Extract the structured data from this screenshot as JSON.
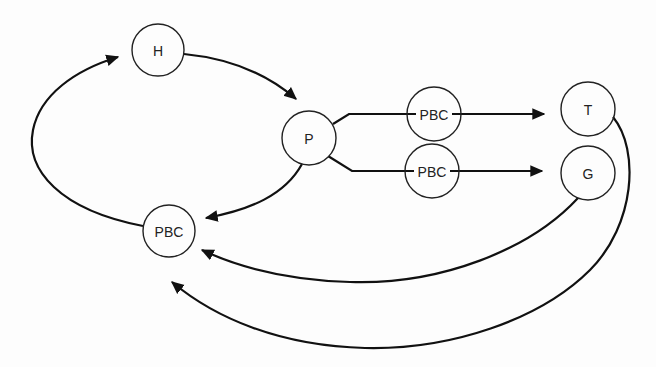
{
  "diagram": {
    "nodes": [
      {
        "id": "H",
        "label": "H",
        "cx": 158,
        "cy": 50,
        "r": 26
      },
      {
        "id": "P",
        "label": "P",
        "cx": 309,
        "cy": 138,
        "r": 27
      },
      {
        "id": "PBC_upper",
        "label": "PBC",
        "cx": 434,
        "cy": 114,
        "r": 27
      },
      {
        "id": "PBC_lower",
        "label": "PBC",
        "cx": 432,
        "cy": 171,
        "r": 27
      },
      {
        "id": "T",
        "label": "T",
        "cx": 588,
        "cy": 109,
        "r": 27
      },
      {
        "id": "G",
        "label": "G",
        "cx": 588,
        "cy": 173,
        "r": 27
      },
      {
        "id": "PBC_left",
        "label": "PBC",
        "cx": 169,
        "cy": 231,
        "r": 26
      }
    ],
    "edges": [
      {
        "from": "PBC_left",
        "to": "H",
        "style": "curved-arrow"
      },
      {
        "from": "H",
        "to": "P",
        "style": "curved-arrow"
      },
      {
        "from": "P",
        "to": "PBC_upper",
        "via": "T",
        "style": "straight-arrow"
      },
      {
        "from": "P",
        "to": "PBC_lower",
        "via": "G",
        "style": "straight-arrow"
      },
      {
        "from": "P",
        "to": "PBC_left",
        "style": "curved-arrow"
      },
      {
        "from": "G",
        "to": "PBC_left",
        "style": "curved-arrow"
      },
      {
        "from": "T",
        "to": "PBC_left",
        "style": "curved-arrow"
      }
    ],
    "colors": {
      "stroke": "#111111",
      "background": "#fdfdfd"
    }
  }
}
